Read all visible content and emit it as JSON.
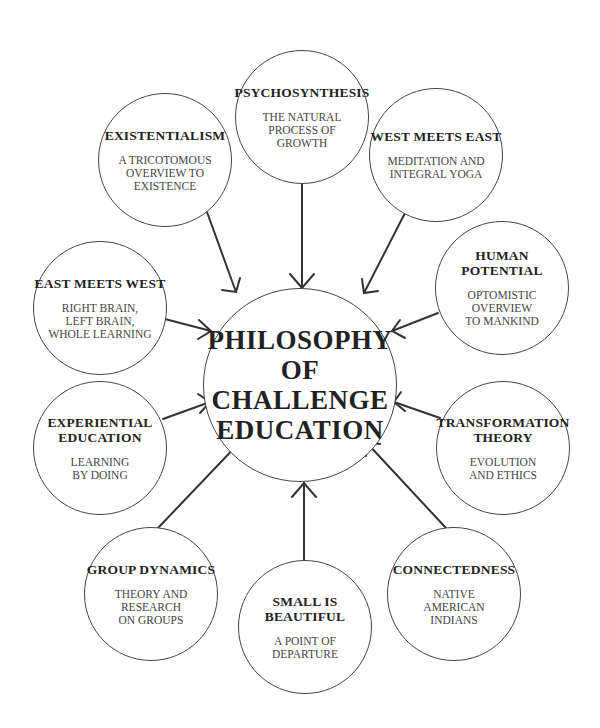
{
  "diagram": {
    "center": {
      "label": "PHILOSOPHY\nOF\nCHALLENGE\nEDUCATION"
    },
    "nodes": [
      {
        "id": "existentialism",
        "title": "EXISTENTIALISM",
        "subtitle": "A TRICOTOMOUS\nOVERVIEW TO\nEXISTENCE"
      },
      {
        "id": "psychosynthesis",
        "title": "PSYCHOSYNTHESIS",
        "subtitle": "THE NATURAL\nPROCESS OF\nGROWTH"
      },
      {
        "id": "west-meets-east",
        "title": "WEST MEETS EAST",
        "subtitle": "MEDITATION AND\nINTEGRAL YOGA"
      },
      {
        "id": "east-meets-west",
        "title": "EAST MEETS WEST",
        "subtitle": "RIGHT BRAIN,\nLEFT BRAIN,\nWHOLE LEARNING"
      },
      {
        "id": "human-potential",
        "title": "HUMAN\nPOTENTIAL",
        "subtitle": "OPTOMISTIC\nOVERVIEW\nTO MANKIND"
      },
      {
        "id": "experiential-education",
        "title": "EXPERIENTIAL\nEDUCATION",
        "subtitle": "LEARNING\nBY DOING"
      },
      {
        "id": "transformation-theory",
        "title": "TRANSFORMATION\nTHEORY",
        "subtitle": "EVOLUTION\nAND ETHICS"
      },
      {
        "id": "group-dynamics",
        "title": "GROUP DYNAMICS",
        "subtitle": "THEORY AND\nRESEARCH\nON GROUPS"
      },
      {
        "id": "small-is-beautiful",
        "title": "SMALL IS\nBEAUTIFUL",
        "subtitle": "A POINT OF\nDEPARTURE"
      },
      {
        "id": "connectedness",
        "title": "CONNECTEDNESS",
        "subtitle": "NATIVE\nAMERICAN\nINDIANS"
      }
    ],
    "edges": [
      {
        "from": "existentialism",
        "to": "center"
      },
      {
        "from": "psychosynthesis",
        "to": "center"
      },
      {
        "from": "west-meets-east",
        "to": "center"
      },
      {
        "from": "east-meets-west",
        "to": "center"
      },
      {
        "from": "human-potential",
        "to": "center"
      },
      {
        "from": "experiential-education",
        "to": "center"
      },
      {
        "from": "transformation-theory",
        "to": "center"
      },
      {
        "from": "group-dynamics",
        "to": "center"
      },
      {
        "from": "small-is-beautiful",
        "to": "center"
      },
      {
        "from": "connectedness",
        "to": "center"
      }
    ],
    "colors": {
      "line": "#333333",
      "circle": "#444444",
      "text": "#222222"
    }
  }
}
